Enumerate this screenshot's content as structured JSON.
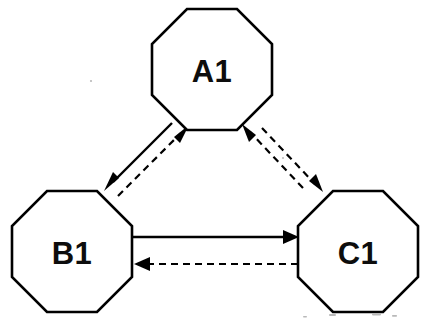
{
  "diagram": {
    "background_color": "#ffffff",
    "stroke_color": "#000000",
    "nodes": [
      {
        "id": "A1",
        "label": "A1",
        "shape": "octagon",
        "position": "top-center",
        "center_x": 212,
        "center_y": 70,
        "radius": 62
      },
      {
        "id": "B1",
        "label": "B1",
        "shape": "octagon",
        "position": "bottom-left",
        "center_x": 72,
        "center_y": 252,
        "radius": 62
      },
      {
        "id": "C1",
        "label": "C1",
        "shape": "octagon",
        "position": "bottom-right",
        "center_x": 358,
        "center_y": 252,
        "radius": 62
      }
    ],
    "edges": [
      {
        "id": "a1-to-b1",
        "from": "A1",
        "to": "B1",
        "style": "solid",
        "arrow": "single",
        "direction": "down-left"
      },
      {
        "id": "b1-to-a1",
        "from": "B1",
        "to": "A1",
        "style": "dashed",
        "arrow": "single",
        "direction": "up-right"
      },
      {
        "id": "b1-to-c1",
        "from": "B1",
        "to": "C1",
        "style": "solid",
        "arrow": "single",
        "direction": "right"
      },
      {
        "id": "c1-to-b1",
        "from": "C1",
        "to": "B1",
        "style": "dashed",
        "arrow": "single",
        "direction": "left"
      },
      {
        "id": "c1-to-a1",
        "from": "C1",
        "to": "A1",
        "style": "dashed",
        "arrow": "single",
        "direction": "up-left"
      },
      {
        "id": "a1-to-c1",
        "from": "A1",
        "to": "C1",
        "style": "dashed",
        "arrow": "single",
        "direction": "down-right"
      }
    ]
  }
}
